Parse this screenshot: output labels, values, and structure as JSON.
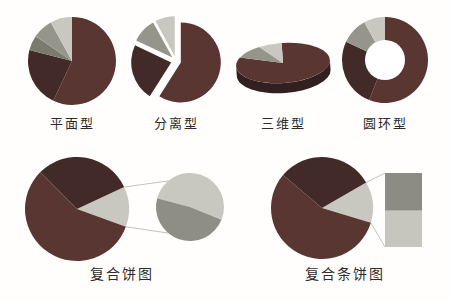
{
  "page": {
    "background": "#fffefd",
    "text_color": "#2d2b29",
    "connector_color": "#bcbbb5"
  },
  "palette": {
    "dark_red": "#5a3633",
    "maroon": "#422a28",
    "olive_gray": "#7b7a6e",
    "gray": "#96958c",
    "light_gray": "#c8c7c0",
    "mid_gray": "#8d8c84",
    "wall_dark": "#31201f",
    "hole_white": "#ffffff"
  },
  "chart_data": [
    {
      "type": "pie",
      "variant": "pie",
      "title": "平面型",
      "unit": "percent",
      "slices": [
        {
          "value": 57,
          "color": "#5a3633"
        },
        {
          "value": 22,
          "color": "#422a28"
        },
        {
          "value": 5.5,
          "color": "#7b7a6e"
        },
        {
          "value": 7.5,
          "color": "#96958c"
        },
        {
          "value": 8,
          "color": "#c8c7c0"
        }
      ],
      "layout": {
        "w": 100,
        "h": 100,
        "cx": 50,
        "cy": 50,
        "r": 44,
        "start_angle": 0
      }
    },
    {
      "type": "pie",
      "variant": "exploded",
      "title": "分离型",
      "unit": "percent",
      "slices": [
        {
          "value": 59,
          "color": "#5a3633"
        },
        {
          "value": 23,
          "color": "#422a28"
        },
        {
          "value": 10,
          "color": "#96958c"
        },
        {
          "value": 8,
          "color": "#c8c7c0"
        }
      ],
      "layout": {
        "w": 104,
        "h": 104,
        "cx": 52,
        "cy": 51,
        "r": 40,
        "start_angle": 0,
        "explode": 5
      }
    },
    {
      "type": "pie",
      "variant": "pie3d",
      "title": "三维型",
      "unit": "percent",
      "slices": [
        {
          "value": 82,
          "color": "#5a3633"
        },
        {
          "value": 10,
          "color": "#96958c"
        },
        {
          "value": 8,
          "color": "#c8c7c0"
        }
      ],
      "layout": {
        "w": 110,
        "h": 72,
        "cx": 55,
        "cy": 31,
        "rx": 47,
        "ry": 20,
        "depth": 10,
        "rotate": -4,
        "start_angle": 0,
        "wall_color": "#31201f"
      }
    },
    {
      "type": "pie",
      "variant": "donut",
      "title": "圆环型",
      "unit": "percent",
      "slices": [
        {
          "value": 56,
          "color": "#5a3633"
        },
        {
          "value": 26,
          "color": "#422a28"
        },
        {
          "value": 10,
          "color": "#96958c"
        },
        {
          "value": 8,
          "color": "#c8c7c0"
        }
      ],
      "layout": {
        "w": 96,
        "h": 96,
        "cx": 48,
        "cy": 47,
        "r": 43,
        "inner_r": 20,
        "hole_color": "#ffffff",
        "start_angle": 0
      }
    },
    {
      "type": "pie",
      "variant": "pie_of_pie",
      "title": "复合饼图",
      "unit": "percent",
      "slices": [
        {
          "value": 12.5,
          "color": "#c8c7c0"
        },
        {
          "value": 57,
          "color": "#5a3633"
        },
        {
          "value": 30.5,
          "color": "#422a28"
        }
      ],
      "secondary": {
        "slices": [
          {
            "value": 52,
            "color": "#c8c7c0"
          },
          {
            "value": 48,
            "color": "#8f8e86"
          }
        ],
        "start_angle": 285
      },
      "layout": {
        "w": 210,
        "h": 120,
        "cx": 55,
        "cy": 60,
        "r": 52,
        "start_angle": 65,
        "sec_cx": 168,
        "sec_cy": 58,
        "sec_r": 34,
        "connector_angles": [
          320,
          220
        ],
        "connector_color": "#bcbbb5"
      }
    },
    {
      "type": "pie",
      "variant": "bar_of_pie",
      "title": "复合条饼图",
      "unit": "percent",
      "slices": [
        {
          "value": 13,
          "color": "#c8c7c0"
        },
        {
          "value": 56.5,
          "color": "#5a3633"
        },
        {
          "value": 30.5,
          "color": "#422a28"
        }
      ],
      "bar": {
        "segments": [
          {
            "value": 51,
            "color": "#8d8c84"
          },
          {
            "value": 49,
            "color": "#c6c5be"
          }
        ]
      },
      "layout": {
        "w": 178,
        "h": 120,
        "cx": 62,
        "cy": 59,
        "r": 51,
        "start_angle": 60,
        "bar_x": 125,
        "bar_y": 24,
        "bar_w": 37,
        "bar_h": 74,
        "connector_color": "#bcbbb5"
      }
    }
  ]
}
